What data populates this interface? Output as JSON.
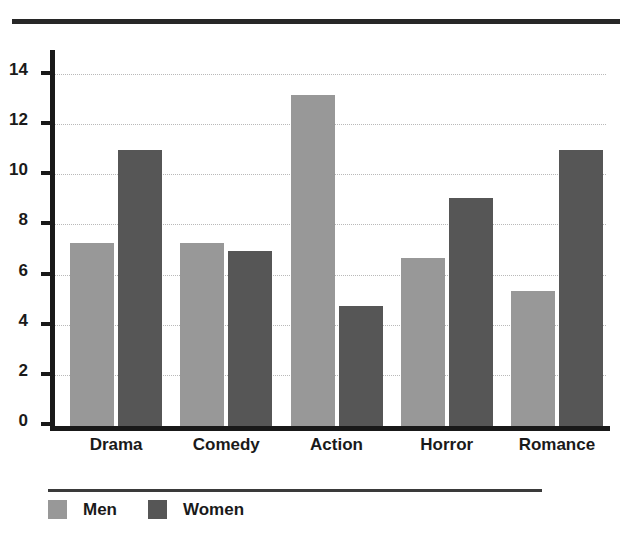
{
  "chart_data": {
    "type": "bar",
    "title": "",
    "subtitle": "",
    "xlabel": "",
    "ylabel": "",
    "categories": [
      "Drama",
      "Comedy",
      "Action",
      "Horror",
      "Romance"
    ],
    "series": [
      {
        "name": "Men",
        "color": "#989898",
        "values": [
          7.3,
          7.3,
          13.2,
          6.7,
          5.4
        ]
      },
      {
        "name": "Women",
        "color": "#565656",
        "values": [
          11.0,
          7.0,
          4.8,
          9.1,
          11.0
        ]
      }
    ],
    "ylim": [
      0,
      15
    ],
    "yticks": [
      0,
      2,
      4,
      6,
      8,
      10,
      12,
      14
    ],
    "ytick_labels": [
      "0",
      "2",
      "4",
      "6",
      "8",
      "10",
      "12",
      "14"
    ],
    "grid": "horizontal-dotted",
    "legend_position": "bottom-left",
    "orientation": "vertical",
    "grouped": true
  },
  "decor": {
    "top_rule": "horizontal-rule",
    "legend_rule": "horizontal-rule"
  }
}
